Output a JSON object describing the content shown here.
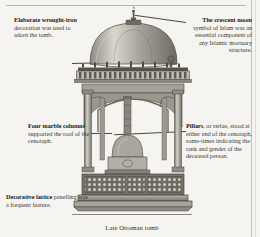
{
  "figure": {
    "caption": "Late Ottoman tomb",
    "background_color": "#f5f4f0",
    "ink_color": "#3a3a36"
  },
  "callouts": [
    {
      "id": "wrought-iron",
      "heading": "Elaborate wrought-iron",
      "body": " decoration was used to adorn the tomb.",
      "position": "top-left"
    },
    {
      "id": "crescent-moon",
      "heading": "The crescent moon",
      "body": " symbol of Islam was an essential component of any Islamic mortuary structure.",
      "position": "top-right"
    },
    {
      "id": "marble-columns",
      "heading": "Four marble columns",
      "body": " supported the roof of the cenotaph.",
      "position": "middle-left"
    },
    {
      "id": "pillars",
      "heading": "Pillars",
      "body": ", or stelae, stood at either end of the cenotaph, some-times indicating the rank and gender of the deceased person.",
      "position": "middle-right"
    },
    {
      "id": "lattice",
      "heading": "Decorative lattice",
      "body": " panelling was a frequent feature.",
      "position": "bottom-left"
    }
  ],
  "illustration": {
    "name": "late-ottoman-tomb-engraving",
    "parts": [
      "crescent-finial",
      "dome",
      "wrought-iron-cornice",
      "marble-column-front-left",
      "marble-column-front-right",
      "marble-column-rear-left",
      "marble-column-rear-right",
      "arch-front",
      "arch-side",
      "cenotaph",
      "stele-pillar",
      "lattice-panelling",
      "plinth-base"
    ]
  }
}
